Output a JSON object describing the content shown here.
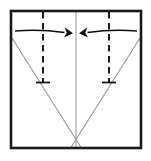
{
  "diagram": {
    "caption": "Square sheet with vertical center crease; two dashed vertical fold lines fold inward toward the center, shown by two opposing curved arrows.",
    "type": "paper-folding-instruction",
    "canvas": {
      "width": 151,
      "height": 161,
      "background": "#ffffff"
    },
    "colors": {
      "background": "#ffffff",
      "frame_stroke": "#1a1a1a",
      "crease_stroke": "#9a9a9a",
      "fold_line_stroke": "#111111",
      "arrow_stroke": "#0d0d0d",
      "arrow_fill": "#0d0d0d"
    },
    "frame": {
      "label": "paper sheet outline",
      "shape": "square",
      "left": 11,
      "top": 11,
      "right": 141,
      "bottom": 148,
      "stroke_width": 2.6
    },
    "center_crease": {
      "label": "vertical center crease",
      "x": 76,
      "y_top": 11,
      "y_bottom": 148,
      "style": "solid-gray"
    },
    "diagonal_creases": [
      {
        "label": "left diagonal crease",
        "x1": 12,
        "y1": 38,
        "x2": 82,
        "y2": 149,
        "style": "solid-gray"
      },
      {
        "label": "right diagonal crease",
        "x1": 140,
        "y1": 38,
        "x2": 70,
        "y2": 149,
        "style": "solid-gray"
      }
    ],
    "diagonal_intersection": {
      "x": 76,
      "y": 140
    },
    "fold_lines": [
      {
        "label": "left dashed fold line",
        "x": 43,
        "y_top": 11,
        "y_bottom": 82,
        "style": "dashed",
        "tick": {
          "x1": 36,
          "x2": 50,
          "y": 82
        }
      },
      {
        "label": "right dashed fold line",
        "x": 109,
        "y_top": 11,
        "y_bottom": 82,
        "style": "dashed",
        "tick": {
          "x1": 102,
          "x2": 116,
          "y": 82
        }
      }
    ],
    "arrows": [
      {
        "label": "left fold arrow",
        "direction": "right",
        "meaning": "fold left edge inward to center",
        "tail_x": 15,
        "tail_y": 31,
        "tip_x": 73,
        "tip_y": 33,
        "curve_bow": -3
      },
      {
        "label": "right fold arrow",
        "direction": "left",
        "meaning": "fold right edge inward to center",
        "tail_x": 137,
        "tail_y": 31,
        "tip_x": 79,
        "tip_y": 33,
        "curve_bow": -3
      }
    ]
  }
}
